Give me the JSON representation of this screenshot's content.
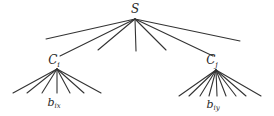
{
  "diagram": {
    "type": "tree",
    "background": "#ffffff",
    "line_color": "#333333",
    "text_color": "#2a2a2a",
    "root": {
      "label": "S",
      "label_pos": [
        135,
        13
      ],
      "apex": [
        135,
        19
      ],
      "children_endpoints": [
        [
          46,
          39
        ],
        [
          60,
          56
        ],
        [
          98,
          50
        ],
        [
          136,
          51
        ],
        [
          166,
          50
        ],
        [
          213,
          56
        ],
        [
          240,
          41
        ]
      ]
    },
    "subtrees": [
      {
        "label": "C",
        "subscript": "i",
        "label_pos": [
          54,
          64
        ],
        "apex": [
          57,
          69
        ],
        "leaf_endpoints": [
          [
            13,
            93
          ],
          [
            27,
            93
          ],
          [
            42,
            93
          ],
          [
            57,
            93
          ],
          [
            70,
            93
          ],
          [
            84,
            93
          ],
          [
            101,
            93
          ]
        ],
        "leaf_label": {
          "label": "b",
          "subscript": "ix",
          "pos": [
            54,
            106
          ]
        }
      },
      {
        "label": "C",
        "subscript": "j",
        "label_pos": [
          212,
          64
        ],
        "apex": [
          216,
          70
        ],
        "leaf_endpoints": [
          [
            179,
            96
          ],
          [
            189,
            96
          ],
          [
            200,
            96
          ],
          [
            209,
            96
          ],
          [
            217,
            96
          ],
          [
            226,
            96
          ],
          [
            236,
            96
          ],
          [
            246,
            96
          ],
          [
            261,
            96
          ]
        ],
        "leaf_label": {
          "label": "b",
          "subscript": "iy",
          "pos": [
            213,
            108
          ]
        }
      }
    ]
  }
}
